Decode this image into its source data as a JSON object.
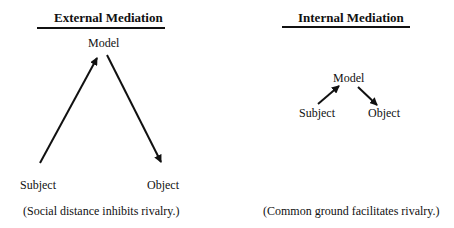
{
  "diagrams": [
    {
      "title": "External Mediation",
      "nodes": {
        "model": "Model",
        "subject": "Subject",
        "object": "Object"
      },
      "caption": "(Social distance inhibits rivalry.)"
    },
    {
      "title": "Internal Mediation",
      "nodes": {
        "model": "Model",
        "subject": "Subject",
        "object": "Object"
      },
      "caption": "(Common ground facilitates rivalry.)"
    }
  ],
  "colors": {
    "ink": "#111111",
    "background": "#ffffff"
  }
}
